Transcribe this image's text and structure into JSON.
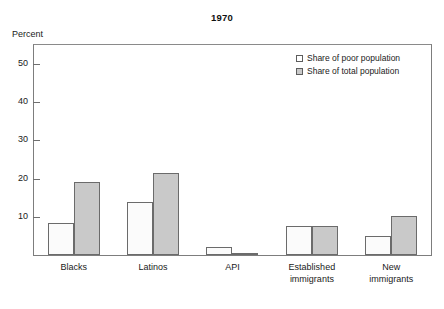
{
  "chart_data": {
    "type": "bar",
    "title": "1970",
    "xlabel": "",
    "ylabel": "Percent",
    "ylim": [
      0,
      55
    ],
    "yticks": [
      10,
      20,
      30,
      40,
      50
    ],
    "grid": false,
    "legend_position": "top-right",
    "categories": [
      "Blacks",
      "Latinos",
      "API",
      "Established immigrants",
      "New immigrants"
    ],
    "category_lines": [
      [
        "Blacks"
      ],
      [
        "Latinos"
      ],
      [
        "API"
      ],
      [
        "Established",
        "immigrants"
      ],
      [
        "New",
        "immigrants"
      ]
    ],
    "series": [
      {
        "name": "Share of poor population",
        "color": "#ffffff",
        "values": [
          8.4,
          14.0,
          2.1,
          7.7,
          5.0
        ]
      },
      {
        "name": "Share of total population",
        "color": "#c9c9c9",
        "values": [
          19.1,
          21.5,
          0.5,
          7.7,
          10.3
        ]
      }
    ]
  },
  "legend": {
    "items": [
      {
        "label": "Share of poor population",
        "swatch": "open-square-icon"
      },
      {
        "label": "Share of total population",
        "swatch": "filled-square-icon"
      }
    ]
  },
  "axis": {
    "y_caption": "Percent",
    "y_tick_labels": [
      "10",
      "20",
      "30",
      "40",
      "50"
    ]
  },
  "colors": {
    "bar_poor": "#fbfbfb",
    "bar_total": "#c9c9c9",
    "bar_outline": "#6b6b6b",
    "frame": "#7d7d7d",
    "text": "#1a1a1a"
  }
}
